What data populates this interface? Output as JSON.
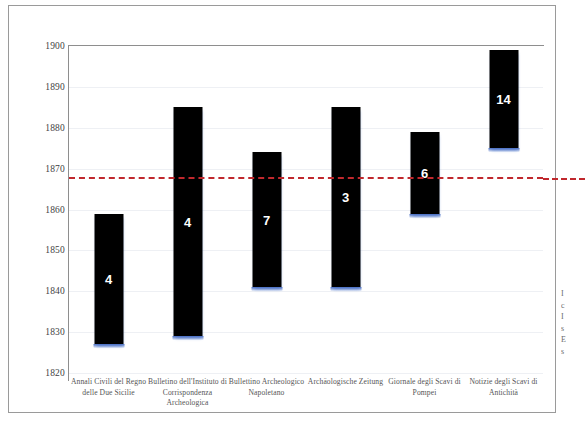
{
  "chart_data": {
    "type": "bar",
    "bar_style": "floating-range",
    "title": "",
    "subtitle": "",
    "xlabel": "",
    "ylabel": "",
    "ylim": [
      1820,
      1900
    ],
    "ytick_labels": [
      "1900",
      "1890",
      "1880",
      "1870",
      "1860",
      "1850",
      "1840",
      "1830",
      "1820"
    ],
    "ytick_values": [
      1900,
      1890,
      1880,
      1870,
      1860,
      1850,
      1840,
      1830,
      1820
    ],
    "grid": true,
    "legend": "none",
    "categories": [
      "Annali Civili del Regno delle Due Sicilie",
      "Bulletino dell'Instituto di Corrispondenza Archeologica",
      "Bullettino Archeologico Napoletano",
      "Archäologische Zeitung",
      "Giornale degli Scavi di Pompei",
      "Notizie degli Scavi di Antichità"
    ],
    "bars": [
      {
        "category": "Annali Civili del Regno delle Due Sicilie",
        "start": 1827,
        "end": 1859,
        "label": "4"
      },
      {
        "category": "Bulletino dell'Instituto di Corrispondenza Archeologica",
        "start": 1829,
        "end": 1885,
        "label": "4"
      },
      {
        "category": "Bullettino Archeologico Napoletano",
        "start": 1841,
        "end": 1874,
        "label": "7"
      },
      {
        "category": "Archäologische Zeitung",
        "start": 1841,
        "end": 1885,
        "label": "3"
      },
      {
        "category": "Giornale degli Scavi di Pompei",
        "start": 1859,
        "end": 1879,
        "label": "6"
      },
      {
        "category": "Notizie degli Scavi di Antichità",
        "start": 1875,
        "end": 1899,
        "label": "14"
      }
    ],
    "annotations": [
      {
        "type": "hline",
        "value": 1868,
        "style": "dashed",
        "color": "#c0282d"
      }
    ],
    "colors": {
      "bar": "#000000",
      "bar_shadow": "#4a6fc4",
      "reference_line": "#c0282d",
      "gridline": "#eef0f4",
      "axis": "#8e8e8e",
      "value_label": "#ffffff",
      "tick_label": "#3f3f3f",
      "category_label": "#555555",
      "page_border": "#9a9a9a",
      "background": "#ffffff"
    }
  },
  "margin_text": {
    "lines": [
      "I",
      "c",
      "I",
      "s",
      "E",
      "s"
    ]
  }
}
